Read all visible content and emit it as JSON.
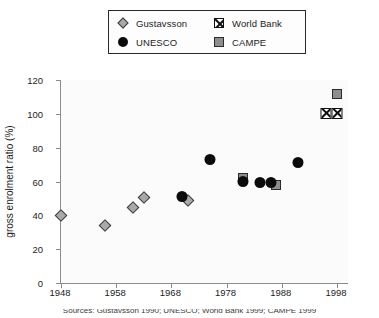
{
  "legend": {
    "entries": [
      {
        "label": "Gustavsson",
        "marker": "diamond-icon",
        "color": "#a9a9a9"
      },
      {
        "label": "World Bank",
        "marker": "x-square-icon",
        "color": "#111111"
      },
      {
        "label": "UNESCO",
        "marker": "circle-icon",
        "color": "#0b0b0b"
      },
      {
        "label": "CAMPE",
        "marker": "square-icon",
        "color": "#8e8e8e"
      }
    ]
  },
  "axes": {
    "y_title": "gross enrolment ratio (%)",
    "y_ticks": [
      "0",
      "20",
      "40",
      "60",
      "80",
      "100",
      "120"
    ],
    "x_ticks": [
      "1948",
      "1958",
      "1968",
      "1978",
      "1988",
      "1998"
    ]
  },
  "caption": {
    "text": "Sources: Gustavsson 1990; UNESCO; World Bank 1999; CAMPE 1999"
  },
  "chart_data": {
    "type": "scatter",
    "title": "",
    "xlabel": "",
    "ylabel": "gross enrolment ratio (%)",
    "xlim": [
      1948,
      2000
    ],
    "ylim": [
      0,
      120
    ],
    "ytick_values": [
      0,
      20,
      40,
      60,
      80,
      100,
      120
    ],
    "xtick_values": [
      1948,
      1958,
      1968,
      1978,
      1988,
      1998
    ],
    "grid": false,
    "legend_position": "top-center",
    "series": [
      {
        "name": "Gustavsson",
        "marker": "diamond",
        "color": "#a9a9a9",
        "points": [
          {
            "x": 1948,
            "y": 40
          },
          {
            "x": 1956,
            "y": 34
          },
          {
            "x": 1961,
            "y": 45
          },
          {
            "x": 1963,
            "y": 51
          },
          {
            "x": 1971,
            "y": 49
          }
        ]
      },
      {
        "name": "UNESCO",
        "marker": "circle",
        "color": "#0b0b0b",
        "points": [
          {
            "x": 1970,
            "y": 51
          },
          {
            "x": 1975,
            "y": 73
          },
          {
            "x": 1981,
            "y": 60
          },
          {
            "x": 1984,
            "y": 59
          },
          {
            "x": 1986,
            "y": 59
          },
          {
            "x": 1991,
            "y": 71
          }
        ]
      },
      {
        "name": "CAMPE",
        "marker": "square",
        "color": "#8e8e8e",
        "points": [
          {
            "x": 1981,
            "y": 62
          },
          {
            "x": 1987,
            "y": 58
          },
          {
            "x": 1998,
            "y": 112
          }
        ]
      },
      {
        "name": "World Bank",
        "marker": "x-square",
        "color": "#111111",
        "points": [
          {
            "x": 1996,
            "y": 100
          },
          {
            "x": 1998,
            "y": 100
          }
        ]
      }
    ]
  }
}
